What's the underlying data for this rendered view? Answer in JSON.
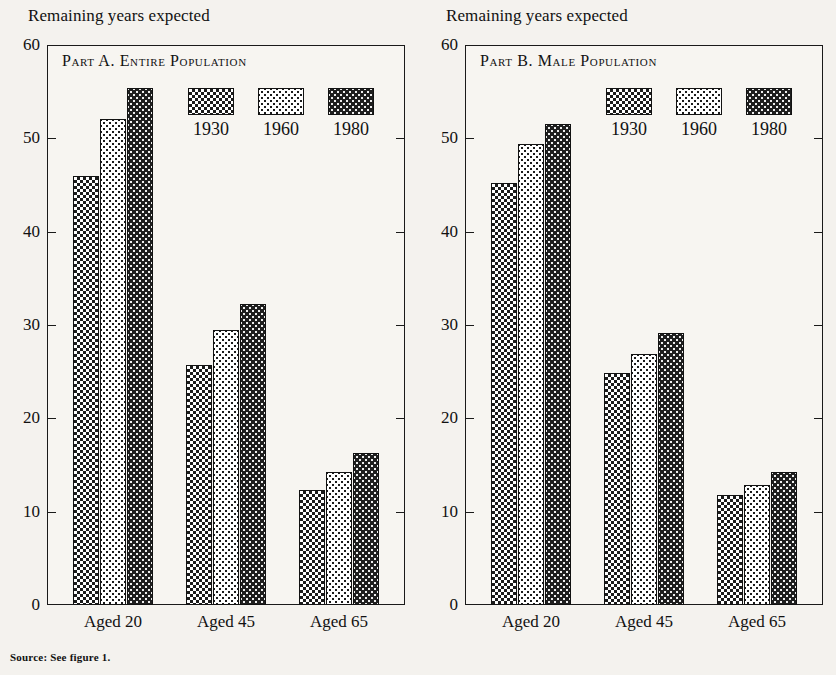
{
  "figure": {
    "source_note": "Source:  See figure 1.",
    "yaxis_caption": "Remaining years expected"
  },
  "panels": [
    {
      "id": "part-a",
      "title_prefix": "Part A.",
      "title_main": "Entire Population"
    },
    {
      "id": "part-b",
      "title_prefix": "Part B.",
      "title_main": "Male Population"
    }
  ],
  "legend": {
    "items": [
      {
        "label": "1930",
        "pattern": "checkerboard-medium"
      },
      {
        "label": "1960",
        "pattern": "dots-light"
      },
      {
        "label": "1980",
        "pattern": "dots-dark"
      }
    ]
  },
  "yticks": [
    "60",
    "50",
    "40",
    "30",
    "20",
    "10",
    "0"
  ],
  "xlabels": [
    "Aged 20",
    "Aged 45",
    "Aged 65"
  ],
  "chart_data": [
    {
      "type": "bar",
      "title": "Part A. Entire Population",
      "subtitle": "",
      "xlabel": "",
      "ylabel": "Remaining years expected",
      "ylim": [
        0,
        60
      ],
      "yticks": [
        0,
        10,
        20,
        30,
        40,
        50,
        60
      ],
      "grid": false,
      "legend_position": "inside-top-right",
      "categories": [
        "Aged 20",
        "Aged 45",
        "Aged 65"
      ],
      "series": [
        {
          "name": "1930",
          "values": [
            46.0,
            25.7,
            12.3
          ]
        },
        {
          "name": "1960",
          "values": [
            52.1,
            29.5,
            14.2
          ]
        },
        {
          "name": "1980",
          "values": [
            55.4,
            32.2,
            16.3
          ]
        }
      ]
    },
    {
      "type": "bar",
      "title": "Part B. Male Population",
      "subtitle": "",
      "xlabel": "",
      "ylabel": "Remaining years expected",
      "ylim": [
        0,
        60
      ],
      "yticks": [
        0,
        10,
        20,
        30,
        40,
        50,
        60
      ],
      "grid": false,
      "legend_position": "inside-top-right",
      "categories": [
        "Aged 20",
        "Aged 45",
        "Aged 65"
      ],
      "series": [
        {
          "name": "1930",
          "values": [
            45.2,
            24.9,
            11.8
          ]
        },
        {
          "name": "1960",
          "values": [
            49.4,
            26.9,
            12.9
          ]
        },
        {
          "name": "1980",
          "values": [
            51.5,
            29.1,
            14.2
          ]
        }
      ]
    }
  ]
}
